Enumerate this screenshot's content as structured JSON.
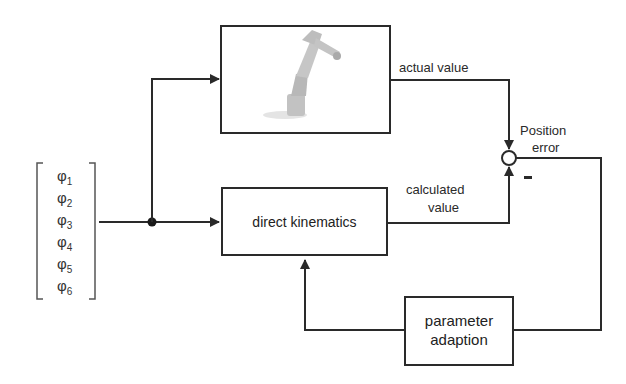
{
  "diagram": {
    "type": "control-loop-block-diagram",
    "input_vector": {
      "symbols": [
        {
          "base": "φ",
          "index": "1"
        },
        {
          "base": "φ",
          "index": "2"
        },
        {
          "base": "φ",
          "index": "3"
        },
        {
          "base": "φ",
          "index": "4"
        },
        {
          "base": "φ",
          "index": "5"
        },
        {
          "base": "φ",
          "index": "6"
        }
      ]
    },
    "blocks": {
      "robot": {
        "label": "",
        "image": "industrial-robot-arm"
      },
      "direct_kinematics": {
        "label": "direct kinematics"
      },
      "parameter_adaption": {
        "line1": "parameter",
        "line2": "adaption"
      }
    },
    "signals": {
      "actual_value": "actual value",
      "calculated_value_line1": "calculated",
      "calculated_value_line2": "value",
      "position_error_line1": "Position",
      "position_error_line2": "error",
      "minus_sign": "-"
    },
    "colors": {
      "line": "#2a2a2a",
      "robot": "#bdbdbd",
      "background": "#ffffff"
    }
  }
}
